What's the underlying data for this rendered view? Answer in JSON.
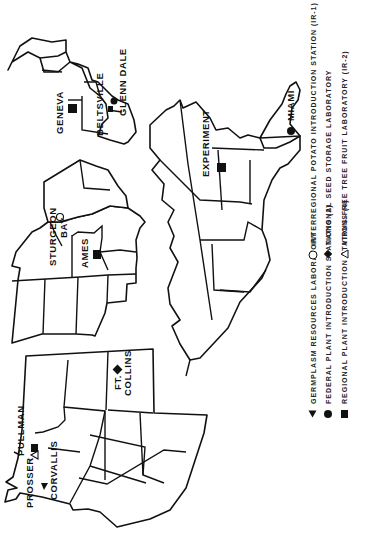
{
  "map": {
    "orientation": "rotated-90-ccw",
    "stations": [
      {
        "id": "pullman",
        "label": "PULLMAN",
        "symbol": "square",
        "type": "Regional Plant Introduction Station"
      },
      {
        "id": "prosser",
        "label": "PROSSER",
        "symbol": "triangle-down-open",
        "type": "Virus-Free Tree Fruit Laboratory (IR-2)"
      },
      {
        "id": "corvallis",
        "label": "CORVALLIS",
        "symbol": "triangle-filled",
        "type": "Germplasm Resources Laboratory"
      },
      {
        "id": "ft-collins",
        "label_line1": "FT.",
        "label_line2": "COLLINS",
        "symbol": "diamond",
        "type": "National Seed Storage Laboratory"
      },
      {
        "id": "sturgeon-bay",
        "label_line1": "STURGEON",
        "label_line2": "BAY",
        "symbol": "circle-open",
        "type": "Interregional Potato Introduction Station (IR-1)"
      },
      {
        "id": "ames",
        "label": "AMES",
        "symbol": "square",
        "type": "Regional Plant Introduction Station"
      },
      {
        "id": "experiment",
        "label": "EXPERIMENT",
        "symbol": "square",
        "type": "Regional Plant Introduction Station"
      },
      {
        "id": "miami",
        "label": "MIAMI",
        "symbol": "circle-filled",
        "type": "Federal Plant Introduction Station"
      },
      {
        "id": "geneva",
        "label": "GENEVA",
        "symbol": "square",
        "type": "Regional Plant Introduction Station"
      },
      {
        "id": "beltsville",
        "label": "BELTSVILLE",
        "symbol": "square",
        "type": "Germplasm Resources Laboratory"
      },
      {
        "id": "glenn-dale",
        "label": "GLENN DALE",
        "symbol": "circle-filled",
        "type": "Federal Plant Introduction Station"
      }
    ]
  },
  "legend": {
    "left": [
      {
        "symbol": "triangle-filled",
        "text": "GERMPLASM  RESOURCES  LABORATORY"
      },
      {
        "symbol": "circle-filled",
        "text": "FEDERAL  PLANT  INTRODUCTION  STATIONS (2)"
      },
      {
        "symbol": "square",
        "text": "REGIONAL  PLANT  INTRODUCTION  STATIONS (4)"
      }
    ],
    "right": [
      {
        "symbol": "circle-open",
        "text": "INTERREGIONAL  POTATO  INTRODUCTION  STATION (IR-1)"
      },
      {
        "symbol": "diamond",
        "text": "NATIONAL  SEED  STORAGE  LABORATORY"
      },
      {
        "symbol": "triangle-down-open",
        "text": "VIRUS-FREE  TREE  FRUIT  LABORATORY (IR-2)"
      }
    ]
  }
}
